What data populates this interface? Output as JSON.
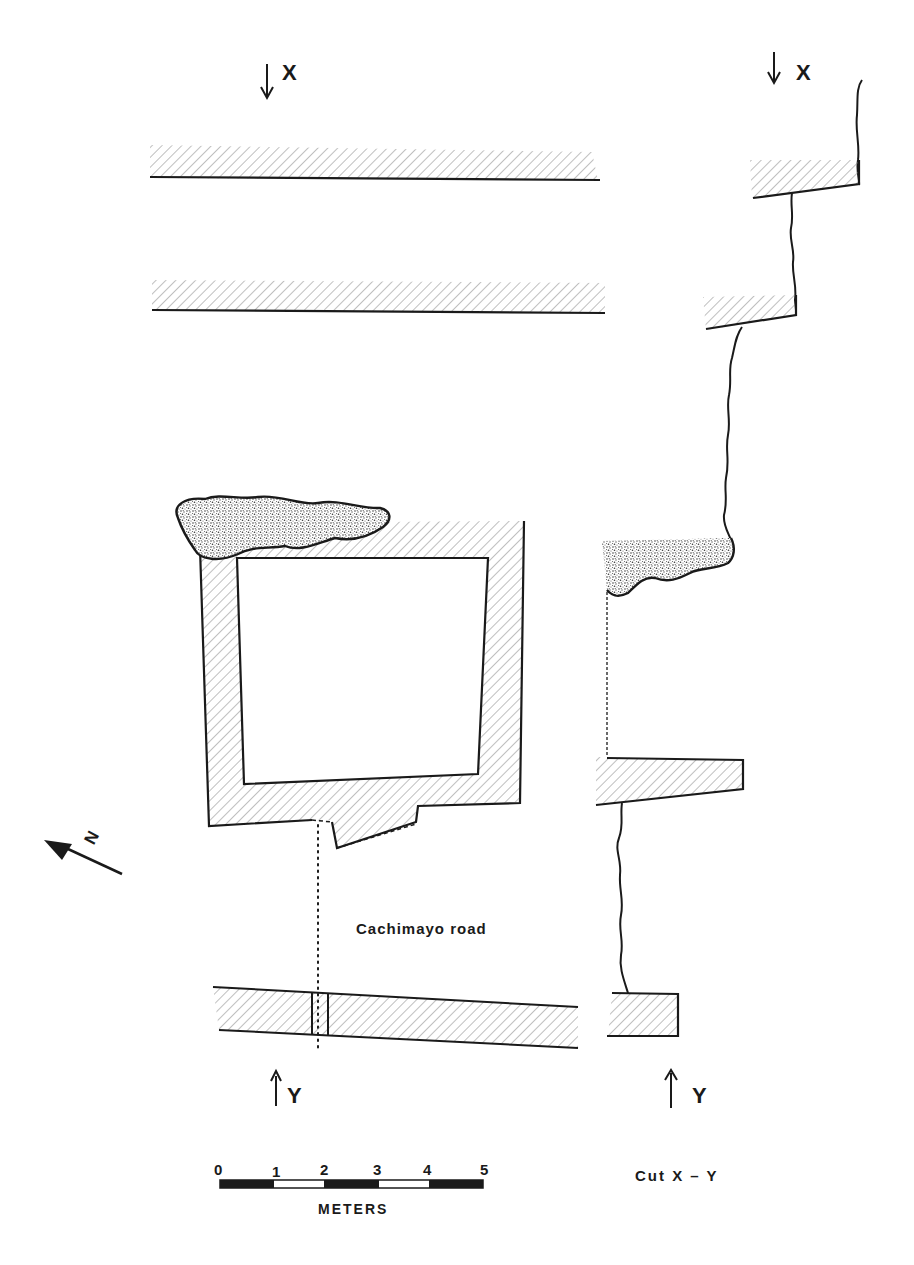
{
  "figure": {
    "type": "archaeological plan and section",
    "plan": {
      "section_markers": {
        "top": "X",
        "bottom": "Y"
      },
      "road_label": "Cachimayo road",
      "north_arrow_label": "N"
    },
    "section": {
      "title": "Cut X-Y",
      "title_display": "Cut  X – Y",
      "top_marker": "X",
      "bottom_marker": "Y"
    },
    "scale_bar": {
      "ticks": [
        "0",
        "1",
        "2",
        "3",
        "4",
        "5"
      ],
      "unit": "METERS",
      "segments": [
        "black",
        "white",
        "black",
        "white",
        "black"
      ]
    },
    "colors": {
      "ink": "#1a1a1a",
      "hatch": "#8a8a8a",
      "stipple": "#555555",
      "paper": "#ffffff"
    },
    "legend_fills": {
      "hatched": "wall / masonry",
      "stippled": "rubble / fill"
    }
  }
}
